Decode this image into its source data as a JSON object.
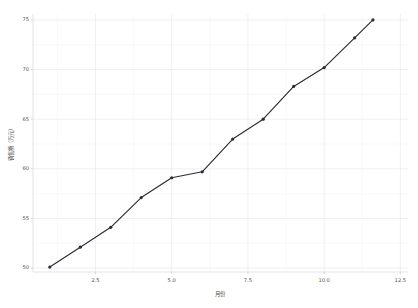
{
  "chart_data": {
    "type": "line",
    "title": "",
    "xlabel": "月份",
    "ylabel": "销售额（万元）",
    "xlim": [
      0.45,
      12.75
    ],
    "ylim": [
      49.6,
      75.6
    ],
    "grid": true,
    "legend": "none",
    "x": [
      1,
      2,
      3,
      4,
      5,
      6,
      7,
      8,
      9,
      10,
      11,
      11.6
    ],
    "categories": [
      "1",
      "2",
      "3",
      "4",
      "5",
      "6",
      "7",
      "8",
      "9",
      "10",
      "11",
      "12"
    ],
    "values": [
      50.1,
      52.1,
      54.1,
      57.1,
      59.1,
      59.7,
      63.0,
      65.0,
      68.3,
      70.2,
      73.2,
      75.0
    ],
    "series": [
      {
        "name": "销售额",
        "values": [
          50.1,
          52.1,
          54.1,
          57.1,
          59.1,
          59.7,
          63.0,
          65.0,
          68.3,
          70.2,
          73.2,
          75.0
        ]
      }
    ],
    "xticks": [
      2.5,
      5.0,
      7.5,
      10.0,
      12.5
    ],
    "xtick_labels": [
      "2.5",
      "5.0",
      "7.5",
      "10.0",
      "12.5"
    ],
    "yticks": [
      50,
      55,
      60,
      65,
      70,
      75
    ],
    "ytick_labels": [
      "50",
      "55",
      "60",
      "65",
      "70",
      "75"
    ],
    "marker": "circle",
    "line_color": "#2b2b33",
    "marker_color": "#2b2b33",
    "background_color": "#ffffff",
    "grid_color": "#e9e9ec"
  },
  "figure": {
    "plot_left": 33,
    "plot_right": 408,
    "plot_top": 14,
    "plot_bottom": 272
  }
}
